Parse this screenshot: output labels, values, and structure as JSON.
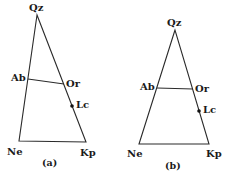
{
  "figures": [
    {
      "caption": "(a)",
      "vertices": {
        "Qz": {
          "label": "Qz",
          "x": 37,
          "y": 15
        },
        "Ne": {
          "label": "Ne",
          "x": 19,
          "y": 141
        },
        "Kp": {
          "label": "Kp",
          "x": 86,
          "y": 142
        }
      },
      "points": {
        "Ab": {
          "label": "Ab",
          "x": 28,
          "y": 79
        },
        "Or": {
          "label": "Or",
          "x": 64,
          "y": 84
        },
        "Lc": {
          "label": "Lc",
          "x": 72,
          "y": 106
        }
      }
    },
    {
      "caption": "(b)",
      "vertices": {
        "Qz": {
          "label": "Qz",
          "x": 175,
          "y": 30
        },
        "Ne": {
          "label": "Ne",
          "x": 139,
          "y": 144
        },
        "Kp": {
          "label": "Kp",
          "x": 209,
          "y": 144
        }
      },
      "points": {
        "Ab": {
          "label": "Ab",
          "x": 157,
          "y": 88
        },
        "Or": {
          "label": "Or",
          "x": 193,
          "y": 89
        },
        "Lc": {
          "label": "Lc",
          "x": 199,
          "y": 111
        }
      }
    }
  ],
  "colors": {
    "line": "#2a2a2a",
    "text": "#1a1a1a",
    "background": "#ffffff"
  }
}
